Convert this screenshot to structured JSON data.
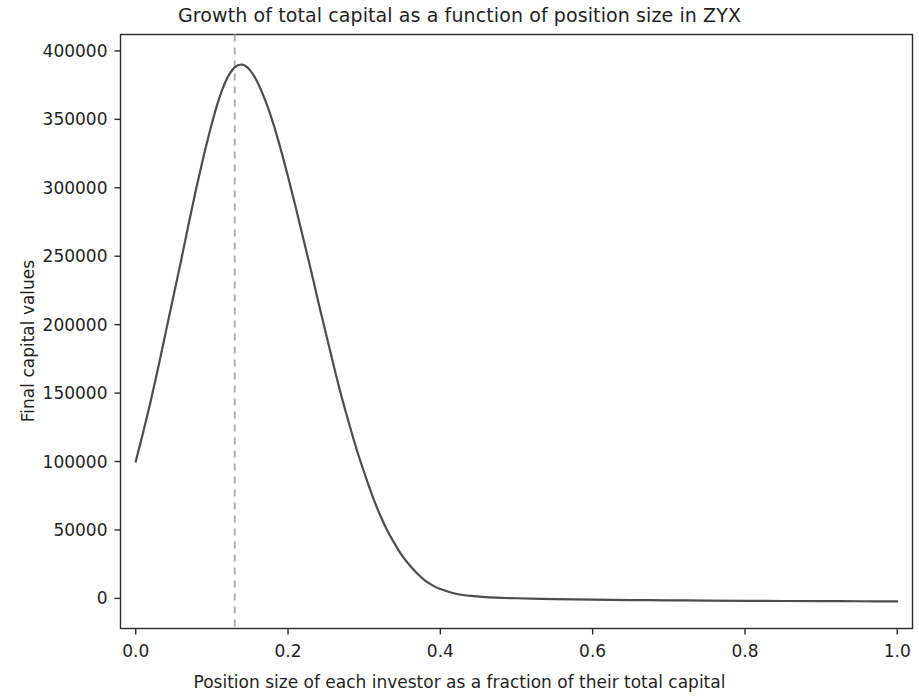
{
  "chart_data": {
    "type": "line",
    "title": "Growth of total capital as a function of position size in ZYX",
    "xlabel": "Position size of each investor as a fraction of their total capital",
    "ylabel": "Final capital values",
    "xlim": [
      -0.02,
      1.02
    ],
    "ylim": [
      -22000,
      412000
    ],
    "xticks": [
      0.0,
      0.2,
      0.4,
      0.6,
      0.8,
      1.0
    ],
    "xtick_labels": [
      "0.0",
      "0.2",
      "0.4",
      "0.6",
      "0.8",
      "1.0"
    ],
    "yticks": [
      0,
      50000,
      100000,
      150000,
      200000,
      250000,
      300000,
      350000,
      400000
    ],
    "ytick_labels": [
      "0",
      "50000",
      "100000",
      "150000",
      "200000",
      "250000",
      "300000",
      "350000",
      "400000"
    ],
    "grid": false,
    "legend": null,
    "series": [
      {
        "name": "Final capital values",
        "color": "#4d4d4d",
        "linewidth": 2.2,
        "linestyle": "solid",
        "x": [
          0.0,
          0.01,
          0.02,
          0.03,
          0.04,
          0.05,
          0.06,
          0.07,
          0.08,
          0.09,
          0.1,
          0.11,
          0.12,
          0.13,
          0.14,
          0.15,
          0.16,
          0.17,
          0.18,
          0.19,
          0.2,
          0.21,
          0.22,
          0.23,
          0.24,
          0.25,
          0.26,
          0.27,
          0.28,
          0.29,
          0.3,
          0.31,
          0.32,
          0.33,
          0.34,
          0.35,
          0.36,
          0.37,
          0.38,
          0.39,
          0.4,
          0.42,
          0.44,
          0.46,
          0.48,
          0.5,
          0.55,
          0.6,
          0.65,
          0.7,
          0.75,
          0.8,
          0.85,
          0.9,
          0.95,
          1.0
        ],
        "y": [
          100000,
          122000,
          145000,
          170000,
          196000,
          222000,
          248000,
          275000,
          301000,
          325000,
          347000,
          366000,
          380000,
          388000,
          390000,
          386000,
          377000,
          364000,
          348000,
          329000,
          308000,
          286000,
          263000,
          240000,
          216000,
          193000,
          170000,
          148000,
          128000,
          109000,
          92000,
          76000,
          62000,
          50000,
          40000,
          31000,
          24000,
          18000,
          13000,
          9500,
          6800,
          3400,
          1800,
          900,
          400,
          100,
          -500,
          -900,
          -1200,
          -1400,
          -1600,
          -1800,
          -1900,
          -2000,
          -2100,
          -2200
        ]
      }
    ],
    "annotations": [
      {
        "type": "vline",
        "name": "optimal-position-size-line",
        "x": 0.13,
        "color": "#b0b0b0",
        "linestyle": "dashed",
        "linewidth": 2.0
      }
    ]
  }
}
